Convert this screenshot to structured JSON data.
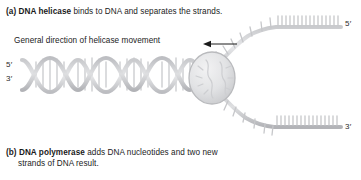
{
  "figure": {
    "title_a_lead": "(a) DNA helicase",
    "title_a_rest": " binds to DNA and separates the strands.",
    "title_b_lead": "(b) DNA polymerase",
    "title_b_rest": " adds DNA nucleotides and two new",
    "title_b_line2": "strands of DNA result.",
    "movement_label": "General direction of helicase movement",
    "labels": {
      "five_prime_left": "5′",
      "three_prime_left": "3′",
      "five_prime_right": "5′",
      "three_prime_right": "3′"
    },
    "colors": {
      "background": "#ffffff",
      "text": "#1b1b1b",
      "strand_light": "#d2d3d5",
      "strand_mid": "#bdbec1",
      "strand_dark": "#a8a9ad",
      "helicase_fill": "#e3e4e6",
      "helicase_stroke": "#b9babd",
      "arrow": "#1b1b1b"
    },
    "geometry": {
      "helix_turns": 4,
      "helix_rungs_per_turn": 5,
      "top_strand_ticks": 16,
      "bottom_strand_ticks": 16,
      "fork_ticks": 5
    },
    "icons": {
      "arrow": "arrow-left-icon",
      "helicase": "helicase-enzyme-icon",
      "helix": "dna-double-helix-icon"
    }
  }
}
